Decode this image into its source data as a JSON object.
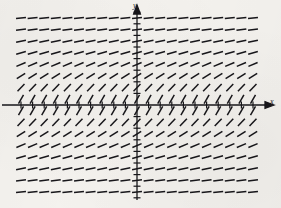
{
  "figure": {
    "kind": "slope-field",
    "background_color": "#f4f2ee",
    "ink_color": "#17161a"
  },
  "axes": {
    "x_label": "x",
    "y_label": "y",
    "origin_px": [
      137,
      105
    ],
    "x_axis_y_px": 105,
    "y_axis_x_px": 137,
    "x_tick_count": 21,
    "y_tick_count": 16,
    "tick_spacing_px": 11.6,
    "x_tick_length_px": 7,
    "y_tick_length_px": 7,
    "arrowheads": [
      "x-positive",
      "y-positive"
    ]
  },
  "chart_data": {
    "type": "scatter",
    "title": "",
    "xlabel": "x",
    "ylabel": "y",
    "grid": false,
    "legend": null,
    "slope_rule": "dy/dx = 1/(1 + y^2)",
    "xlim": [
      -9.5,
      9.5
    ],
    "ylim": [
      -8,
      8
    ],
    "columns": 21,
    "rows": 16,
    "segment_length_px": 10,
    "row_slope_angles_deg": [
      {
        "y": 7.5,
        "angle": 7
      },
      {
        "y": 6.5,
        "angle": 8
      },
      {
        "y": 5.5,
        "angle": 11
      },
      {
        "y": 4.5,
        "angle": 16
      },
      {
        "y": 3.5,
        "angle": 23
      },
      {
        "y": 2.5,
        "angle": 33
      },
      {
        "y": 1.5,
        "angle": 46
      },
      {
        "y": 0.5,
        "angle": 60
      },
      {
        "y": -0.5,
        "angle": 60
      },
      {
        "y": -1.5,
        "angle": 46
      },
      {
        "y": -2.5,
        "angle": 33
      },
      {
        "y": -3.5,
        "angle": 23
      },
      {
        "y": -4.5,
        "angle": 16
      },
      {
        "y": -5.5,
        "angle": 11
      },
      {
        "y": -6.5,
        "angle": 8
      },
      {
        "y": -7.5,
        "angle": 7
      }
    ]
  }
}
